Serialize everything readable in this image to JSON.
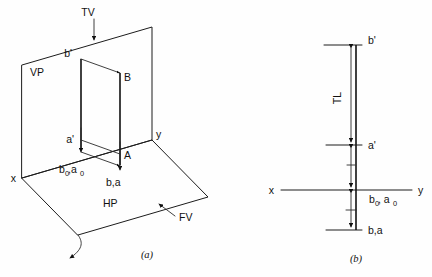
{
  "figure": {
    "background_color": "#fefefe",
    "line_color": "#111111"
  },
  "panel_a": {
    "caption": "(a)",
    "labels": {
      "tv": "TV",
      "vp": "VP",
      "hp": "HP",
      "fv": "FV",
      "b_prime": "b'",
      "a_prime": "a'",
      "point_B": "B",
      "point_A": "A",
      "b0_a0_main": "b",
      "b0_a0_sub1": "0",
      "b0_a0_mid": ",a",
      "b0_a0_sub2": "0",
      "ba": "b,a",
      "axis_x": "x",
      "axis_y": "y"
    }
  },
  "panel_b": {
    "caption": "(b)",
    "labels": {
      "b_prime": "b'",
      "a_prime": "a'",
      "true_length": "TL",
      "b0_a0_main": "b",
      "b0_a0_sub1": "0",
      "b0_a0_mid": ", a",
      "b0_a0_sub2": "0",
      "ba": "b,a",
      "axis_x": "x",
      "axis_y": "y"
    }
  }
}
